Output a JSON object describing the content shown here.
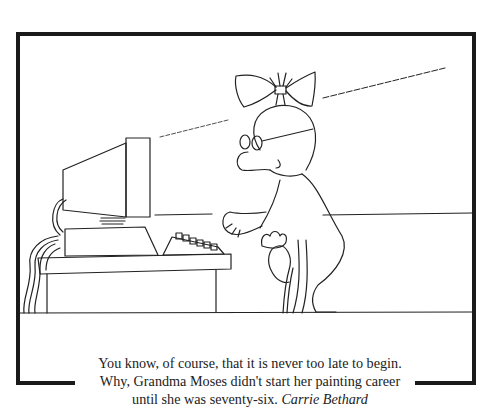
{
  "cartoon": {
    "subject": "elderly woman with bow and glasses using a cane approaches a desktop computer",
    "frame_color": "#1a1a1a",
    "ink_color": "#222222"
  },
  "caption": {
    "line1": "You know, of course, that it is never too late to begin.",
    "line2": "Why, Grandma Moses didn't start her painting career",
    "line3_text": "until she was seventy-six.",
    "author": "Carrie Bethard"
  }
}
